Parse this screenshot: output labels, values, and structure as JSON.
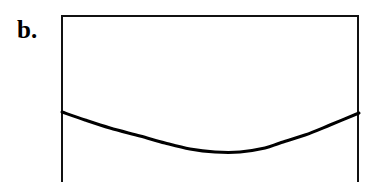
{
  "figure": {
    "panel_label": "b.",
    "background_color": "#ffffff",
    "line_color": "#111111",
    "curve_color": "#000000"
  },
  "frame": {
    "x": 61,
    "y": 15,
    "width": 298,
    "height": 167,
    "border_width": 2,
    "sides_drawn": "top-left-right",
    "bottom_open": true
  },
  "chart_data": {
    "type": "line",
    "title": "",
    "xlabel": "",
    "ylabel": "",
    "grid": false,
    "legend": null,
    "axis_ticks": [],
    "tick_labels": [],
    "xlim": [
      62,
      359
    ],
    "ylim": [
      182,
      15
    ],
    "series": [
      {
        "name": "curve",
        "color": "#000000",
        "line_width": 3,
        "shape": "u-shaped-concave-up",
        "x": [
          62,
          85,
          110,
          140,
          165,
          190,
          215,
          240,
          265,
          280,
          305,
          330,
          359
        ],
        "y": [
          112,
          120,
          128,
          136,
          143,
          149,
          152,
          152,
          148,
          143,
          135,
          125,
          113
        ]
      }
    ],
    "annotations": [
      {
        "text": "b.",
        "x": 17,
        "y": 17,
        "role": "panel-label"
      }
    ]
  }
}
